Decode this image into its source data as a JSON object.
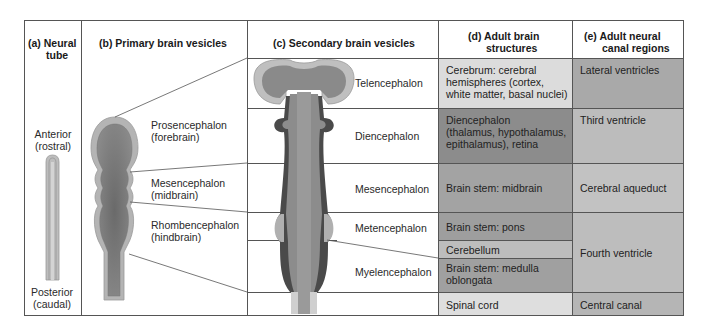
{
  "columns": {
    "a": {
      "letter": "(a)",
      "title_line1": "Neural",
      "title_line2": "tube"
    },
    "b": {
      "letter": "(b)",
      "title": "Primary brain vesicles"
    },
    "c": {
      "letter": "(c)",
      "title": "Secondary brain vesicles"
    },
    "d": {
      "letter": "(d)",
      "title_line1": "Adult brain",
      "title_line2": "structures"
    },
    "e": {
      "letter": "(e)",
      "title_line1": "Adult neural",
      "title_line2": "canal regions"
    }
  },
  "neural_tube": {
    "anterior_line1": "Anterior",
    "anterior_line2": "(rostral)",
    "posterior_line1": "Posterior",
    "posterior_line2": "(caudal)"
  },
  "primary_vesicles": [
    {
      "name": "Prosencephalon",
      "common": "(forebrain)"
    },
    {
      "name": "Mesencephalon",
      "common": "(midbrain)"
    },
    {
      "name": "Rhombencephalon",
      "common": "(hindbrain)"
    }
  ],
  "secondary_vesicles": [
    {
      "name": "Telencephalon"
    },
    {
      "name": "Diencephalon"
    },
    {
      "name": "Mesencephalon"
    },
    {
      "name": "Metencephalon"
    },
    {
      "name": "Myelencephalon"
    }
  ],
  "adult_structures": [
    {
      "line1": "Cerebrum: cerebral",
      "line2": "hemispheres (cortex,",
      "line3": "white matter, basal nuclei)",
      "color": "#dcdcdc"
    },
    {
      "line1": "Diencephalon",
      "line2": "(thalamus, hypothalamus,",
      "line3": "epithalamus), retina",
      "color": "#8c8c8c"
    },
    {
      "line1": "Brain stem: midbrain",
      "color": "#a3a3a3"
    },
    {
      "line1": "Brain stem: pons",
      "color": "#9e9e9e"
    },
    {
      "line1": "Cerebellum",
      "color": "#bdbdbd"
    },
    {
      "line1": "Brain stem: medulla",
      "line2": "oblongata",
      "color": "#a0a0a0"
    },
    {
      "line1": "Spinal cord",
      "color": "#dedede"
    }
  ],
  "canal_regions": [
    {
      "label": "Lateral ventricles",
      "color": "#a9a9a9"
    },
    {
      "label": "Third ventricle",
      "color": "#bcbcbc"
    },
    {
      "label": "Cerebral aqueduct",
      "color": "#c2c2c2"
    },
    {
      "label": "Fourth ventricle",
      "color": "#bdbdbd"
    },
    {
      "label": "Central canal",
      "color": "#b5b5b5"
    }
  ]
}
